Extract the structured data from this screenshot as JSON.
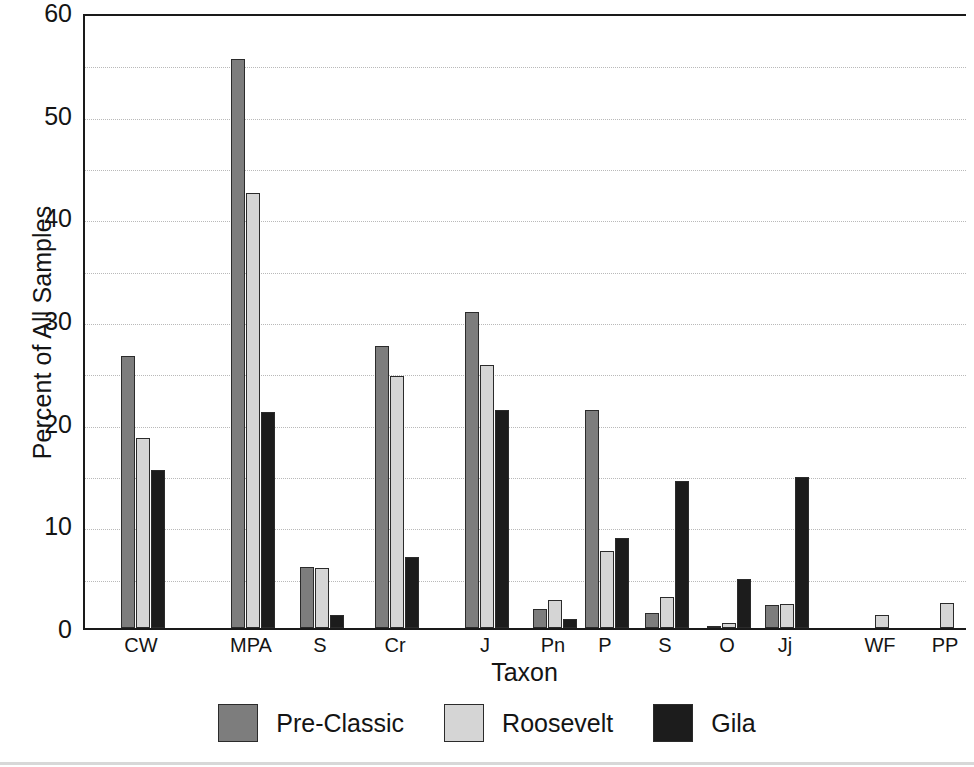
{
  "chart_data": {
    "type": "bar",
    "title": "",
    "xlabel": "Taxon",
    "ylabel": "Percent of All Samples",
    "ylim": [
      0,
      60
    ],
    "ytick_values": [
      0,
      10,
      20,
      30,
      40,
      50,
      60
    ],
    "ytick_labels": [
      "0",
      "10",
      "20",
      "30",
      "40",
      "50",
      "60"
    ],
    "minor_gridline_values": [
      5,
      10,
      15,
      20,
      25,
      30,
      35,
      40,
      45,
      50,
      55
    ],
    "grid": true,
    "legend_position": "bottom",
    "categories": [
      "CW",
      "MPA",
      "S",
      "Cr",
      "J",
      "Pn",
      "P",
      "S",
      "O",
      "Jj",
      "WF",
      "PP",
      "DF"
    ],
    "series": [
      {
        "name": "Pre-Classic",
        "color": "#7d7d7d",
        "values": [
          26.5,
          55.4,
          5.9,
          27.5,
          30.8,
          1.9,
          21.2,
          1.5,
          0.1,
          2.2,
          0.0,
          0.0,
          0.0
        ]
      },
      {
        "name": "Roosevelt",
        "color": "#d5d5d5",
        "values": [
          18.5,
          42.4,
          5.8,
          24.5,
          25.6,
          2.7,
          7.5,
          3.0,
          0.5,
          2.3,
          1.3,
          2.4,
          2.6
        ]
      },
      {
        "name": "Gila",
        "color": "#1c1c1c",
        "values": [
          15.4,
          21.0,
          1.3,
          6.9,
          21.2,
          0.9,
          8.8,
          14.3,
          4.8,
          14.7,
          0.0,
          0.0,
          0.0
        ]
      }
    ],
    "group_x_positions": [
      36,
      146,
      215,
      290,
      380,
      448,
      500,
      560,
      622,
      680,
      775,
      840,
      905
    ]
  },
  "legend": {
    "entries": [
      {
        "label": "Pre-Classic",
        "swatch": "#7d7d7d"
      },
      {
        "label": "Roosevelt",
        "swatch": "#d5d5d5"
      },
      {
        "label": "Gila",
        "swatch": "#1c1c1c"
      }
    ]
  }
}
